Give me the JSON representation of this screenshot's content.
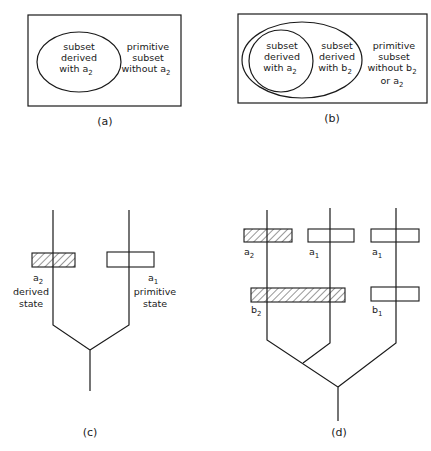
{
  "panels": {
    "a": {
      "caption": "(a)",
      "inner": [
        "subset",
        "derived",
        "with a",
        "2"
      ],
      "outer": [
        "primitive",
        "subset",
        "without a",
        "2"
      ]
    },
    "b": {
      "caption": "(b)",
      "inner": [
        "subset",
        "derived",
        "with a",
        "2"
      ],
      "middle": [
        "subset",
        "derived",
        "with b",
        "2"
      ],
      "outer": [
        "primitive",
        "subset",
        "without b",
        "2",
        "or a",
        "2"
      ]
    },
    "c": {
      "caption": "(c)",
      "left_label": "a",
      "left_sub": "2",
      "left_desc": [
        "derived",
        "state"
      ],
      "right_label": "a",
      "right_sub": "1",
      "right_desc": [
        "primitive",
        "state"
      ]
    },
    "d": {
      "caption": "(d)",
      "row1": [
        {
          "l": "a",
          "s": "2"
        },
        {
          "l": "a",
          "s": "1"
        },
        {
          "l": "a",
          "s": "1"
        }
      ],
      "row2": [
        {
          "l": "b",
          "s": "2"
        },
        {
          "l": "b",
          "s": "1"
        }
      ]
    }
  }
}
